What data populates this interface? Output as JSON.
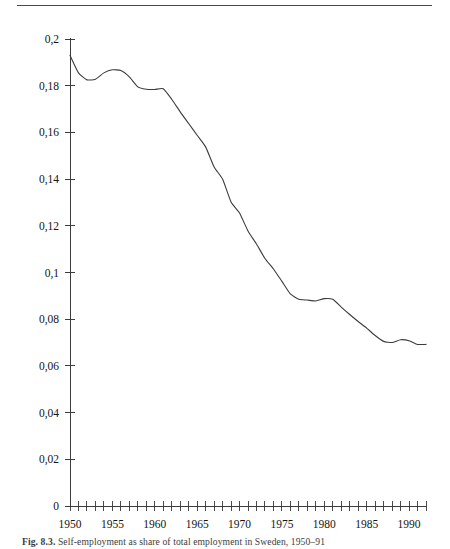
{
  "figure": {
    "caption_label": "Fig. 8.3.",
    "caption_text": "Self-employment as share of total employment in Sweden, 1950–91"
  },
  "chart_data": {
    "type": "line",
    "title": "",
    "xlabel": "",
    "ylabel": "",
    "xlim": [
      1950,
      1992
    ],
    "ylim": [
      0,
      0.2
    ],
    "grid": false,
    "legend": null,
    "decimal_separator": ",",
    "y_ticklabels": [
      "0",
      "0,02",
      "0,04",
      "0,06",
      "0,08",
      "0,1",
      "0,12",
      "0,14",
      "0,16",
      "0,18",
      "0,2"
    ],
    "y_tickvalues": [
      0,
      0.02,
      0.04,
      0.06,
      0.08,
      0.1,
      0.12,
      0.14,
      0.16,
      0.18,
      0.2
    ],
    "x_ticklabels": [
      "1950",
      "1955",
      "1960",
      "1965",
      "1970",
      "1975",
      "1980",
      "1985",
      "1990"
    ],
    "x_tickvalues": [
      1950,
      1955,
      1960,
      1965,
      1970,
      1975,
      1980,
      1985,
      1990
    ],
    "x_minor_tick_step": 1,
    "series": [
      {
        "name": "self-employment share",
        "x": [
          1950,
          1951,
          1952,
          1953,
          1954,
          1955,
          1956,
          1957,
          1958,
          1959,
          1960,
          1961,
          1962,
          1963,
          1964,
          1965,
          1966,
          1967,
          1968,
          1969,
          1970,
          1971,
          1972,
          1973,
          1974,
          1975,
          1976,
          1977,
          1978,
          1979,
          1980,
          1981,
          1982,
          1983,
          1984,
          1985,
          1986,
          1987,
          1988,
          1989,
          1990,
          1991,
          1992
        ],
        "values": [
          0.193,
          0.1855,
          0.1825,
          0.1828,
          0.1855,
          0.1868,
          0.1865,
          0.1838,
          0.1795,
          0.1785,
          0.1784,
          0.1787,
          0.1742,
          0.1688,
          0.1638,
          0.1588,
          0.1538,
          0.1452,
          0.14,
          0.1302,
          0.1255,
          0.1178,
          0.1122,
          0.106,
          0.1015,
          0.0962,
          0.0908,
          0.0885,
          0.0882,
          0.0878,
          0.0888,
          0.0885,
          0.0852,
          0.082,
          0.079,
          0.0762,
          0.073,
          0.0705,
          0.07,
          0.0712,
          0.0708,
          0.0692,
          0.0692
        ]
      }
    ]
  },
  "axis_geometry": {
    "plot_left_px": 70,
    "plot_bottom_px": 506,
    "plot_top_px": 39,
    "plot_right_px": 426
  }
}
